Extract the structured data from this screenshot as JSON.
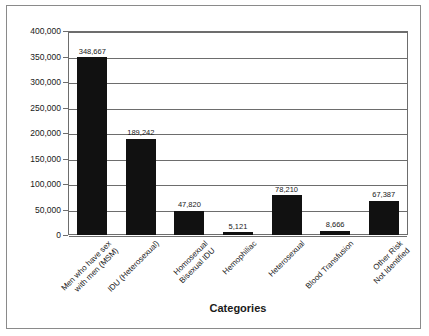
{
  "chart_data": {
    "type": "bar",
    "title": "",
    "xlabel": "Categories",
    "ylabel": "",
    "ylim": [
      0,
      400000
    ],
    "grid": true,
    "legend": false,
    "orientation": "vertical",
    "bar_color": "#111111",
    "frame_color": "#8a8a8a",
    "axis_color": "#6d6d6d",
    "ytick_labels": [
      "400,000",
      "350,000",
      "300,000",
      "250,000",
      "200,000",
      "150,000",
      "100,000",
      "50,000",
      "0"
    ],
    "ytick_values": [
      400000,
      350000,
      300000,
      250000,
      200000,
      150000,
      100000,
      50000,
      0
    ],
    "categories": [
      "Men who have sex\nwith men (MSM)",
      "IDU (Heterosexual)",
      "Homosexual\nBisexual IDU",
      "Hemophiliac",
      "Heterosexual",
      "Blood Transfusion",
      "Other Risk\nNot Identified"
    ],
    "category_lines": [
      [
        "Men who have sex",
        "with men (MSM)"
      ],
      [
        "IDU (Heterosexual)"
      ],
      [
        "Homosexual",
        "Bisexual IDU"
      ],
      [
        "Hemophiliac"
      ],
      [
        "Heterosexual"
      ],
      [
        "Blood Transfusion"
      ],
      [
        "Other Risk",
        "Not Identified"
      ]
    ],
    "values": [
      348667,
      189242,
      47820,
      5121,
      78210,
      8666,
      67387
    ],
    "value_labels": [
      "348,667",
      "189,242",
      "47,820",
      "5,121",
      "78,210",
      "8,666",
      "67,387"
    ]
  }
}
